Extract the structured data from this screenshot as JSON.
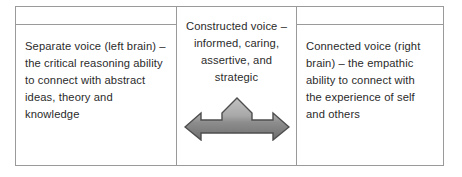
{
  "diagram": {
    "type": "three-column-table",
    "columns": [
      {
        "id": "left",
        "header": "",
        "align": "left",
        "text": "Separate voice (left brain) – the critical reasoning ability to connect with abstract ideas, theory and knowledge"
      },
      {
        "id": "middle",
        "align": "center",
        "text": "Constructed voice – informed, caring, assertive, and strategic",
        "graphic": {
          "name": "three-way-arrow",
          "directions": [
            "left",
            "up",
            "right"
          ],
          "fill_light": "#b3b3b3",
          "fill_dark": "#737373",
          "stroke": "#4d4d4d"
        }
      },
      {
        "id": "right",
        "header": "",
        "align": "left",
        "text": "Connected voice (right brain) – the empathic ability to connect with the experience of self and others"
      }
    ],
    "colors": {
      "border": "#9a9a9a",
      "text": "#2b2b2b",
      "background": "#ffffff"
    }
  }
}
